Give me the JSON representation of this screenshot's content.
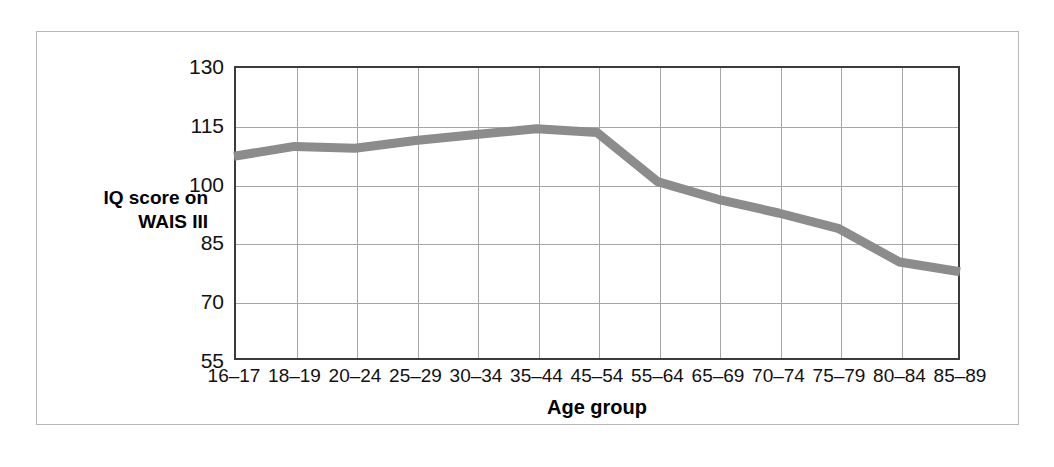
{
  "figure": {
    "background_color": "#ffffff",
    "frame_color": "#b9b9b9",
    "axis_color": "#3b3b3b",
    "grid_color": "#a6a6a6"
  },
  "chart_data": {
    "type": "line",
    "title": "",
    "subtitle": "",
    "xlabel": "Age group",
    "ylabel": "IQ score on WAIS III",
    "ylabel_lines": [
      "IQ score on",
      "WAIS III"
    ],
    "categories": [
      "16–17",
      "18–19",
      "20–24",
      "25–29",
      "30–34",
      "35–44",
      "45–54",
      "55–64",
      "65–69",
      "70–74",
      "75–79",
      "80–84",
      "85–89"
    ],
    "values": [
      107,
      109.5,
      109,
      111,
      112.5,
      114,
      113,
      100.5,
      96,
      92.5,
      88.5,
      80,
      77.5
    ],
    "series": [
      {
        "name": "IQ score on WAIS III",
        "color": "#8c8c8c",
        "line_width": 9,
        "values": [
          107,
          109.5,
          109,
          111,
          112.5,
          114,
          113,
          100.5,
          96,
          92.5,
          88.5,
          80,
          77.5
        ]
      }
    ],
    "yticks": [
      130,
      115,
      100,
      85,
      70,
      55
    ],
    "ytick_labels": [
      "130",
      "115",
      "100",
      "85",
      "70",
      "55"
    ],
    "ylim": [
      55,
      130
    ],
    "grid": true,
    "grid_axes": "both",
    "legend": false,
    "legend_position": "none",
    "markers": false
  }
}
